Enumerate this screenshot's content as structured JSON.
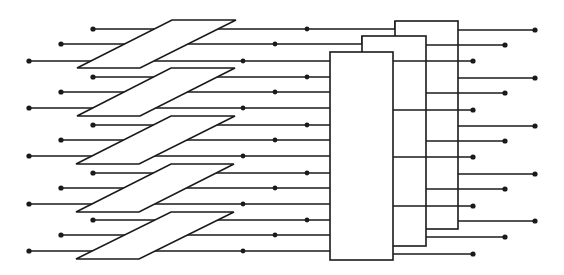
{
  "diagram": {
    "title": "",
    "colors": {
      "stroke": "#1a1a1a",
      "fill": "#ffffff",
      "background": "#ffffff"
    },
    "planes": [
      {
        "top_y": 20,
        "bottom_y": 68,
        "top_x": [
          172,
          236
        ],
        "bottom_x": [
          77,
          140
        ]
      },
      {
        "top_y": 68,
        "bottom_y": 116,
        "top_x": [
          171,
          235
        ],
        "bottom_x": [
          77,
          140
        ]
      },
      {
        "top_y": 116,
        "bottom_y": 164,
        "top_x": [
          171,
          235
        ],
        "bottom_x": [
          76,
          139
        ]
      },
      {
        "top_y": 164,
        "bottom_y": 212,
        "top_x": [
          171,
          234
        ],
        "bottom_x": [
          76,
          139
        ]
      },
      {
        "top_y": 212,
        "bottom_y": 259,
        "top_x": [
          171,
          234
        ],
        "bottom_x": [
          76,
          139
        ]
      }
    ],
    "input_rows": [
      {
        "y": 29,
        "start_x": 93,
        "mid_dot_x": 307,
        "end_x": 395,
        "target": "box-3"
      },
      {
        "y": 44,
        "start_x": 61,
        "mid_dot_x": 275,
        "end_x": 362,
        "target": "box-2"
      },
      {
        "y": 61,
        "start_x": 29,
        "mid_dot_x": 243,
        "end_x": 330,
        "target": "box-1"
      },
      {
        "y": 77,
        "start_x": 93,
        "mid_dot_x": 307,
        "end_x": 330,
        "target": "box-1"
      },
      {
        "y": 92,
        "start_x": 61,
        "mid_dot_x": 275,
        "end_x": 330,
        "target": "box-1"
      },
      {
        "y": 108,
        "start_x": 29,
        "mid_dot_x": 243,
        "end_x": 330,
        "target": "box-1"
      },
      {
        "y": 125,
        "start_x": 93,
        "mid_dot_x": 307,
        "end_x": 330,
        "target": "box-1"
      },
      {
        "y": 140,
        "start_x": 61,
        "mid_dot_x": 275,
        "end_x": 330,
        "target": "box-1"
      },
      {
        "y": 156,
        "start_x": 29,
        "mid_dot_x": 243,
        "end_x": 330,
        "target": "box-1"
      },
      {
        "y": 173,
        "start_x": 93,
        "mid_dot_x": 307,
        "end_x": 330,
        "target": "box-1"
      },
      {
        "y": 188,
        "start_x": 61,
        "mid_dot_x": 275,
        "end_x": 330,
        "target": "box-1"
      },
      {
        "y": 204,
        "start_x": 29,
        "mid_dot_x": 243,
        "end_x": 330,
        "target": "box-1"
      },
      {
        "y": 220,
        "start_x": 93,
        "mid_dot_x": 307,
        "end_x": 330,
        "target": "box-1"
      },
      {
        "y": 235,
        "start_x": 61,
        "mid_dot_x": 275,
        "end_x": 330,
        "target": "box-1"
      },
      {
        "y": 251,
        "start_x": 29,
        "mid_dot_x": 243,
        "end_x": 330,
        "target": "box-1"
      }
    ],
    "boxes": [
      {
        "id": "box-3",
        "x": 395,
        "y": 21,
        "width": 63,
        "height": 208
      },
      {
        "id": "box-2",
        "x": 362,
        "y": 36,
        "width": 64,
        "height": 210
      },
      {
        "id": "box-1",
        "x": 330,
        "y": 52,
        "width": 63,
        "height": 208
      }
    ],
    "output_rows": [
      {
        "from": "box-3",
        "start_x": 458,
        "end_x": 535,
        "ys": [
          30,
          78,
          126,
          174,
          221
        ]
      },
      {
        "from": "box-2",
        "start_x": 426,
        "end_x": 505,
        "ys": [
          45,
          93,
          141,
          189,
          237
        ]
      },
      {
        "from": "box-1",
        "start_x": 393,
        "end_x": 473,
        "ys": [
          61,
          110,
          157,
          206,
          254
        ]
      }
    ]
  }
}
